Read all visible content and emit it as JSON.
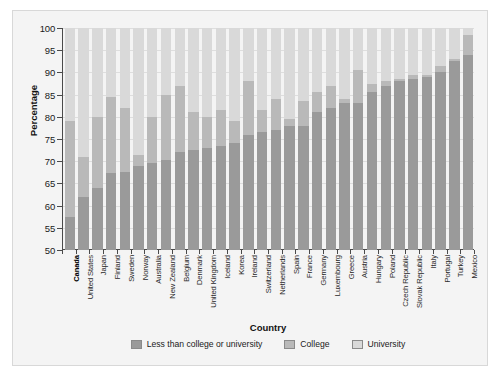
{
  "chart_data": {
    "type": "bar",
    "subtype": "stacked-bar",
    "title": "",
    "xlabel": "Country",
    "ylabel": "Percentage",
    "ylim": [
      50,
      100
    ],
    "ytick_values": [
      50,
      55,
      60,
      65,
      70,
      75,
      80,
      85,
      90,
      95,
      100
    ],
    "ytick_labels": [
      "50",
      "55",
      "60",
      "65",
      "70",
      "75",
      "80",
      "85",
      "90",
      "95",
      "100"
    ],
    "grid": true,
    "legend_position": "bottom",
    "highlight_category": "Canada",
    "note": "Cumulative stacked percentages. Each series value is the cumulative top edge of that segment.",
    "categories": [
      "Canada",
      "United States",
      "Japan",
      "Finland",
      "Sweden",
      "Norway",
      "Australia",
      "New Zealand",
      "Belgium",
      "Denmark",
      "United Kingdom",
      "Iceland",
      "Korea",
      "Ireland",
      "Switzerland",
      "Netherlands",
      "Spain",
      "France",
      "Germany",
      "Luxembourg",
      "Greece",
      "Austria",
      "Hungary",
      "Poland",
      "Czech Republic",
      "Slovak Republic",
      "Italy",
      "Portugal",
      "Turkey",
      "Mexico"
    ],
    "series": [
      {
        "name": "Less than college or university",
        "color": "#9a9a9a",
        "cumulative_tops": [
          57.5,
          62.0,
          64.0,
          67.3,
          67.5,
          69.0,
          69.5,
          70.3,
          72.0,
          72.5,
          73.0,
          73.5,
          74.0,
          76.0,
          76.5,
          77.0,
          78.0,
          78.0,
          81.0,
          82.0,
          83.0,
          83.0,
          85.5,
          87.0,
          88.0,
          88.5,
          89.0,
          90.0,
          92.5,
          94.0
        ]
      },
      {
        "name": "College",
        "color": "#b9b9b9",
        "cumulative_tops": [
          79.0,
          71.0,
          80.0,
          84.5,
          82.0,
          71.5,
          80.0,
          85.0,
          87.0,
          81.0,
          80.0,
          81.5,
          79.0,
          88.0,
          81.5,
          84.0,
          79.5,
          83.5,
          85.5,
          87.0,
          84.0,
          90.5,
          87.5,
          88.0,
          88.5,
          89.5,
          89.5,
          91.5,
          93.0,
          98.5
        ]
      },
      {
        "name": "University",
        "color": "#d9d9d9",
        "cumulative_tops": [
          100,
          100,
          100,
          100,
          100,
          100,
          100,
          100,
          100,
          100,
          100,
          100,
          100,
          100,
          100,
          100,
          100,
          100,
          100,
          100,
          100,
          100,
          100,
          100,
          100,
          100,
          100,
          100,
          100,
          100
        ]
      }
    ]
  },
  "legend": {
    "items": [
      {
        "label": "Less than college or university",
        "color": "#9a9a9a"
      },
      {
        "label": "College",
        "color": "#b9b9b9"
      },
      {
        "label": "University",
        "color": "#d9d9d9"
      }
    ]
  },
  "axes": {
    "y_title": "Percentage",
    "x_title": "Country"
  }
}
